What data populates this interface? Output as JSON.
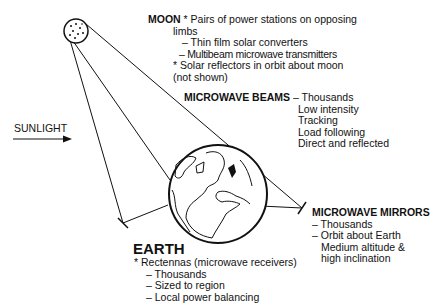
{
  "moon": {
    "title": "MOON",
    "lines": [
      "* Pairs of power stations on opposing",
      "limbs",
      "– Thin film solar converters",
      "– Multibeam microwave transmitters",
      "* Solar reflectors in orbit about moon",
      "(not shown)"
    ]
  },
  "beams": {
    "title": "MICROWAVE BEAMS",
    "first": "– Thousands",
    "lines": [
      "Low intensity",
      "Tracking",
      "Load following",
      "Direct and reflected"
    ]
  },
  "sunlight": {
    "label": "SUNLIGHT"
  },
  "mirrors": {
    "title": "MICROWAVE MIRRORS",
    "lines": [
      "– Thousands",
      "– Orbit about Earth",
      "Medium altitude &",
      "high inclination"
    ]
  },
  "earth": {
    "title": "EARTH",
    "lines": [
      "* Rectennas (microwave receivers)",
      "– Thousands",
      "– Sized to region",
      "– Local power balancing"
    ]
  },
  "colors": {
    "ink": "#111111",
    "background": "#ffffff"
  }
}
